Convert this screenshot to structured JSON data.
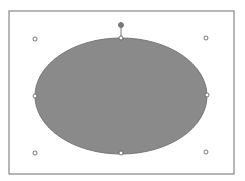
{
  "canvas": {
    "background": "#ffffff",
    "frame": {
      "x": 9,
      "y": 11,
      "width": 225,
      "height": 163,
      "stroke": "#6f6f6f"
    }
  },
  "shape": {
    "type": "ellipse",
    "cx": 121,
    "cy": 96,
    "rx": 86,
    "ry": 58,
    "fill": "#8a8a8a",
    "stroke": "#777777",
    "selected": true
  },
  "rotation_handle": {
    "x": 121,
    "y": 25,
    "fill": "#7a7a7a"
  },
  "handles": [
    {
      "name": "top-left",
      "x": 35,
      "y": 39
    },
    {
      "name": "top",
      "x": 121,
      "y": 38
    },
    {
      "name": "top-right",
      "x": 206,
      "y": 38
    },
    {
      "name": "left",
      "x": 35,
      "y": 96
    },
    {
      "name": "right",
      "x": 207,
      "y": 95
    },
    {
      "name": "bottom-left",
      "x": 35,
      "y": 153
    },
    {
      "name": "bottom",
      "x": 121,
      "y": 153
    },
    {
      "name": "bottom-right",
      "x": 206,
      "y": 152
    }
  ]
}
